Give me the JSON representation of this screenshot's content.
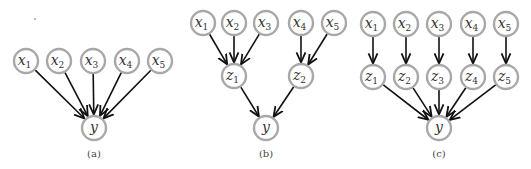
{
  "figure": {
    "panels": [
      {
        "id": "a",
        "caption": "(a)",
        "caption_pos": [
          94,
          157
        ],
        "nodes": [
          {
            "id": "x1",
            "var": "x",
            "sub": "1",
            "cx": 26,
            "cy": 61
          },
          {
            "id": "x2",
            "var": "x",
            "sub": "2",
            "cx": 59,
            "cy": 61
          },
          {
            "id": "x3",
            "var": "x",
            "sub": "3",
            "cx": 93,
            "cy": 61
          },
          {
            "id": "x4",
            "var": "x",
            "sub": "4",
            "cx": 127,
            "cy": 61
          },
          {
            "id": "x5",
            "var": "x",
            "sub": "5",
            "cx": 160,
            "cy": 61
          },
          {
            "id": "y",
            "var": "y",
            "sub": "",
            "cx": 94,
            "cy": 128
          }
        ],
        "edges": [
          [
            "x1",
            "y"
          ],
          [
            "x2",
            "y"
          ],
          [
            "x3",
            "y"
          ],
          [
            "x4",
            "y"
          ],
          [
            "x5",
            "y"
          ]
        ]
      },
      {
        "id": "b",
        "caption": "(b)",
        "caption_pos": [
          266,
          157
        ],
        "nodes": [
          {
            "id": "x1",
            "var": "x",
            "sub": "1",
            "cx": 203,
            "cy": 23
          },
          {
            "id": "x2",
            "var": "x",
            "sub": "2",
            "cx": 234,
            "cy": 23
          },
          {
            "id": "x3",
            "var": "x",
            "sub": "3",
            "cx": 266,
            "cy": 23
          },
          {
            "id": "x4",
            "var": "x",
            "sub": "4",
            "cx": 301,
            "cy": 23
          },
          {
            "id": "x5",
            "var": "x",
            "sub": "5",
            "cx": 334,
            "cy": 23
          },
          {
            "id": "z1",
            "var": "z",
            "sub": "1",
            "cx": 234,
            "cy": 76
          },
          {
            "id": "z2",
            "var": "z",
            "sub": "2",
            "cx": 301,
            "cy": 76
          },
          {
            "id": "y",
            "var": "y",
            "sub": "",
            "cx": 266,
            "cy": 128
          }
        ],
        "edges": [
          [
            "x1",
            "z1"
          ],
          [
            "x2",
            "z1"
          ],
          [
            "x3",
            "z1"
          ],
          [
            "x4",
            "z2"
          ],
          [
            "x5",
            "z2"
          ],
          [
            "z1",
            "y"
          ],
          [
            "z2",
            "y"
          ]
        ]
      },
      {
        "id": "c",
        "caption": "(c)",
        "caption_pos": [
          439,
          157
        ],
        "nodes": [
          {
            "id": "x1",
            "var": "x",
            "sub": "1",
            "cx": 373,
            "cy": 24
          },
          {
            "id": "x2",
            "var": "x",
            "sub": "2",
            "cx": 406,
            "cy": 24
          },
          {
            "id": "x3",
            "var": "x",
            "sub": "3",
            "cx": 439,
            "cy": 24
          },
          {
            "id": "x4",
            "var": "x",
            "sub": "4",
            "cx": 473,
            "cy": 24
          },
          {
            "id": "x5",
            "var": "x",
            "sub": "5",
            "cx": 506,
            "cy": 24
          },
          {
            "id": "z1",
            "var": "z",
            "sub": "1",
            "cx": 373,
            "cy": 77
          },
          {
            "id": "z2",
            "var": "z",
            "sub": "2",
            "cx": 406,
            "cy": 77
          },
          {
            "id": "z3",
            "var": "z",
            "sub": "3",
            "cx": 439,
            "cy": 77
          },
          {
            "id": "z4",
            "var": "z",
            "sub": "4",
            "cx": 473,
            "cy": 77
          },
          {
            "id": "z5",
            "var": "z",
            "sub": "5",
            "cx": 506,
            "cy": 77
          },
          {
            "id": "y",
            "var": "y",
            "sub": "",
            "cx": 439,
            "cy": 128
          }
        ],
        "edges": [
          [
            "x1",
            "z1"
          ],
          [
            "x2",
            "z2"
          ],
          [
            "x3",
            "z3"
          ],
          [
            "x4",
            "z4"
          ],
          [
            "x5",
            "z5"
          ],
          [
            "z1",
            "y"
          ],
          [
            "z2",
            "y"
          ],
          [
            "z3",
            "y"
          ],
          [
            "z4",
            "y"
          ],
          [
            "z5",
            "y"
          ]
        ]
      }
    ],
    "node_radius": 12,
    "colors": {
      "node_stroke": "#a8a8a8",
      "edge": "#111111",
      "text": "#333333"
    }
  }
}
